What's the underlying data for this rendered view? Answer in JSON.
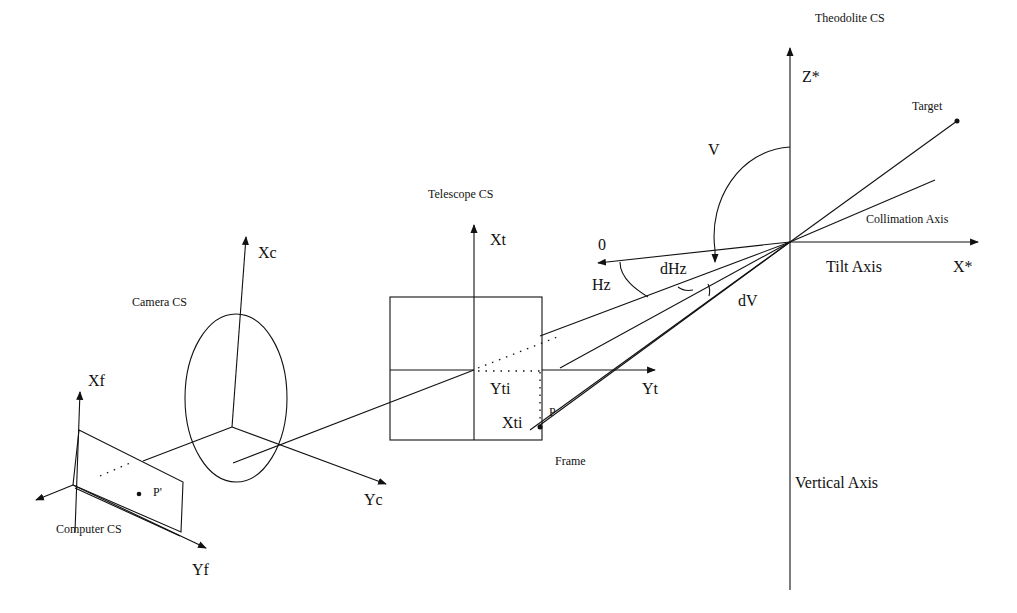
{
  "diagram": {
    "theodolite": {
      "label": "Theodolite CS",
      "z_axis": "Z*",
      "x_axis": "X*",
      "target": "Target",
      "collimation": "Collimation Axis",
      "tilt": "Tilt Axis",
      "vertical": "Vertical Axis",
      "angle_v": "V",
      "angle_hz": "Hz",
      "angle_dhz": "dHz",
      "angle_dv": "dV",
      "zero": "0"
    },
    "telescope": {
      "label": "Telescope CS",
      "x_axis": "Xt",
      "y_axis": "Yt",
      "y_image": "Yti",
      "x_image": "Xti",
      "point": "P",
      "frame": "Frame"
    },
    "camera": {
      "label": "Camera CS",
      "x_axis": "Xc",
      "y_axis": "Yc"
    },
    "computer": {
      "label": "Computer CS",
      "x_axis": "Xf",
      "y_axis": "Yf",
      "point": "P'"
    },
    "colors": {
      "line": "#111111",
      "background": "#ffffff"
    }
  }
}
